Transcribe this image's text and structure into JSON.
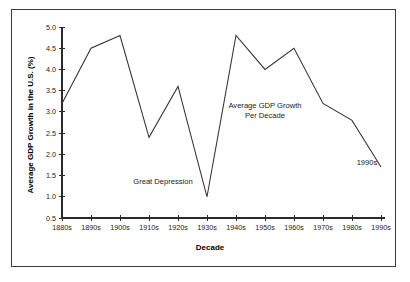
{
  "chart_data": {
    "type": "line",
    "title": "",
    "xlabel": "Decade",
    "ylabel": "Average GDP Growth in the U.S. (%)",
    "categories": [
      "1880s",
      "1890s",
      "1900s",
      "1910s",
      "1920s",
      "1930s",
      "1940s",
      "1950s",
      "1960s",
      "1970s",
      "1980s",
      "1990s"
    ],
    "values": [
      3.2,
      4.5,
      4.8,
      2.4,
      3.6,
      1.0,
      4.8,
      4.0,
      4.5,
      3.2,
      2.8,
      1.7
    ],
    "series": [
      {
        "name": "Average GDP Growth Per Decade",
        "values": [
          3.2,
          4.5,
          4.8,
          2.4,
          3.6,
          1.0,
          4.8,
          4.0,
          4.5,
          3.2,
          2.8,
          1.7
        ]
      }
    ],
    "ylim": [
      0.5,
      5.0
    ],
    "ytick_step": 0.5,
    "yticks": [
      "0.5",
      "1.0",
      "1.5",
      "2.0",
      "2.5",
      "3.0",
      "3.5",
      "4.0",
      "4.5",
      "5.0"
    ],
    "grid": false,
    "legend_position": "none",
    "line_color": "#333333",
    "annotations": [
      {
        "id": "great-depression",
        "text": "Great Depression",
        "x_category": "1930s",
        "y_value": 1.0
      },
      {
        "id": "series-label-line1",
        "text": "Average GDP Growth",
        "x_category": "1950s",
        "y_value": 3.1
      },
      {
        "id": "series-label-line2",
        "text": "Per Decade",
        "x_category": "1950s",
        "y_value": 2.85
      },
      {
        "id": "last-point-label",
        "text": "1990s",
        "x_category": "1990s",
        "y_value": 1.75
      }
    ]
  },
  "labels": {
    "y_axis_title": "Average GDP Growth in the U.S. (%)",
    "x_axis_title": "Decade",
    "annotation_great_depression": "Great Depression",
    "annotation_series_line1": "Average GDP Growth",
    "annotation_series_line2": "Per Decade",
    "annotation_last_point": "1990s"
  }
}
